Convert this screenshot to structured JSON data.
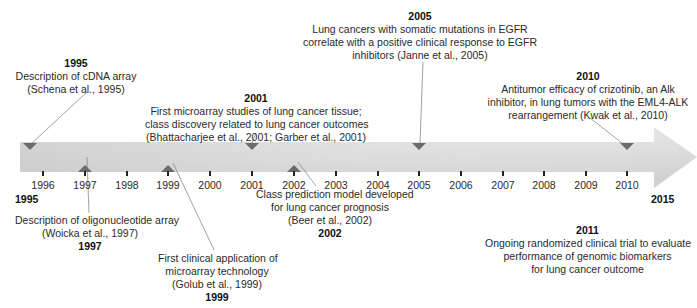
{
  "timeline": {
    "start_label": "1995",
    "end_label": "2015",
    "ticks": [
      "1996",
      "1997",
      "1998",
      "1999",
      "2000",
      "2001",
      "2002",
      "2003",
      "2004",
      "2005",
      "2006",
      "2007",
      "2008",
      "2009",
      "2010"
    ],
    "colors": {
      "bar_light": "#e3e3e3",
      "bar_dark": "#c4c4c4",
      "marker": "#6e6e6e",
      "connector": "#8a8a8a"
    }
  },
  "events": {
    "e1995": {
      "year": "1995",
      "lines": [
        "Description of cDNA array",
        "(Schena et al., 1995)"
      ]
    },
    "e1997": {
      "year": "1997",
      "lines": [
        "Description of oligonucleotide array",
        "(Woicka et al., 1997)"
      ]
    },
    "e1999": {
      "year": "1999",
      "lines": [
        "First clinical application of",
        "microarray technology",
        "(Golub et al., 1999)"
      ]
    },
    "e2001": {
      "year": "2001",
      "lines": [
        "First microarray studies of lung cancer tissue;",
        "class discovery related to lung cancer outcomes",
        "(Bhattacharjee et al., 2001; Garber et al., 2001)"
      ]
    },
    "e2002": {
      "year": "2002",
      "lines": [
        "Class prediction model developed",
        "for lung cancer prognosis",
        "(Beer et al., 2002)"
      ]
    },
    "e2005": {
      "year": "2005",
      "lines": [
        "Lung cancers with somatic mutations in EGFR",
        "correlate with a positive clinical response to EGFR",
        "inhibitors  (Janne et al., 2005)"
      ]
    },
    "e2010": {
      "year": "2010",
      "lines": [
        "Antitumor efficacy of crizotinib, an Alk",
        "inhibitor, in lung tumors with the EML4-ALK",
        "rearrangement  (Kwak et al., 2010)"
      ]
    },
    "e2011": {
      "year": "2011",
      "lines": [
        "Ongoing randomized clinical trial to evaluate",
        "performance of genomic biomarkers",
        "for lung cancer outcome"
      ]
    }
  }
}
